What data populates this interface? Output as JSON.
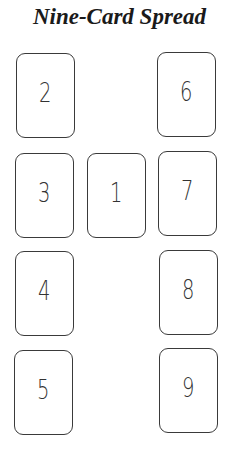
{
  "title": "Nine-Card Spread",
  "cards": [
    {
      "label": "1",
      "x": 87,
      "y": 153
    },
    {
      "label": "2",
      "x": 16,
      "y": 53
    },
    {
      "label": "3",
      "x": 15,
      "y": 153
    },
    {
      "label": "4",
      "x": 15,
      "y": 251
    },
    {
      "label": "5",
      "x": 14,
      "y": 350
    },
    {
      "label": "6",
      "x": 157,
      "y": 52
    },
    {
      "label": "7",
      "x": 158,
      "y": 151
    },
    {
      "label": "8",
      "x": 159,
      "y": 250
    },
    {
      "label": "9",
      "x": 159,
      "y": 348
    }
  ]
}
